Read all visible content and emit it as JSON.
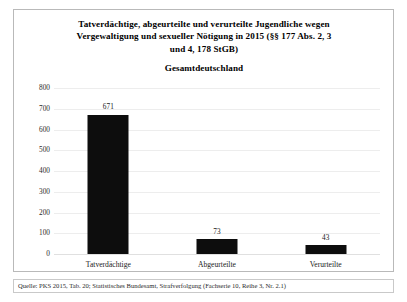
{
  "figure": {
    "title_lines": [
      "Tatverdächtige, abgeurteilte und verurteilte Jugendliche wegen",
      "Vergewaltigung und sexueller Nötigung in 2015 (§§ 177 Abs. 2, 3",
      "und 4, 178 StGB)"
    ],
    "subtitle": "Gesamtdeutschland",
    "footnote": "Quelle: PKS 2015, Tab. 20; Statistisches Bundesamt, Strafverfolgung (Fachserie 10, Reihe 3, Nr. 2.1)",
    "bar_color": "#0d0d0d",
    "grid_color": "#ededed",
    "border_color": "#b9b9b9"
  },
  "chart_data": {
    "type": "bar",
    "title": "Tatverdächtige, abgeurteilte und verurteilte Jugendliche wegen Vergewaltigung und sexueller Nötigung in 2015 (§§ 177 Abs. 2, 3 und 4, 178 StGB)",
    "subtitle": "Gesamtdeutschland",
    "categories": [
      "Tatverdächtige",
      "Abgeurteilte",
      "Verurteilte"
    ],
    "values": [
      671,
      73,
      43
    ],
    "xlabel": "",
    "ylabel": "",
    "ylim": [
      0,
      800
    ],
    "yticks": [
      0,
      100,
      200,
      300,
      400,
      500,
      600,
      700,
      800
    ],
    "ytick_labels": [
      "0",
      "100",
      "200",
      "300",
      "400",
      "500",
      "600",
      "700",
      "800"
    ],
    "grid": true,
    "grid_axis": "y",
    "legend": false,
    "data_labels": [
      "671",
      "73",
      "43"
    ],
    "source_note": "Quelle: PKS 2015, Tab. 20; Statistisches Bundesamt, Strafverfolgung (Fachserie 10, Reihe 3, Nr. 2.1)"
  }
}
